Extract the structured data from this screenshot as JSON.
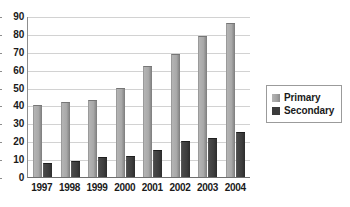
{
  "chart_data": {
    "type": "bar",
    "title": "",
    "xlabel": "",
    "ylabel": "",
    "categories": [
      "1997",
      "1998",
      "1999",
      "2000",
      "2001",
      "2002",
      "2003",
      "2004"
    ],
    "series": [
      {
        "name": "Primary",
        "values": [
          40,
          42,
          43,
          50,
          62,
          69,
          79,
          86
        ],
        "color": "#a9a9a9"
      },
      {
        "name": "Secondary",
        "values": [
          8,
          9,
          11,
          12,
          15,
          20,
          22,
          25
        ],
        "color": "#3b3b3b"
      }
    ],
    "ylim": [
      0,
      90
    ],
    "ytick_values": [
      90,
      80,
      70,
      60,
      50,
      40,
      30,
      20,
      10,
      0
    ],
    "ytick_labels": [
      "90",
      "80",
      "70",
      "60",
      "50",
      "40",
      "30",
      "20",
      "10",
      "0"
    ],
    "grid": true,
    "grid_axis": "y",
    "legend_position": "right"
  },
  "legend": {
    "entries": [
      {
        "label": "Primary",
        "swatch": "primary-swatch"
      },
      {
        "label": "Secondary",
        "swatch": "secondary-swatch"
      }
    ]
  },
  "title_remnant": ""
}
